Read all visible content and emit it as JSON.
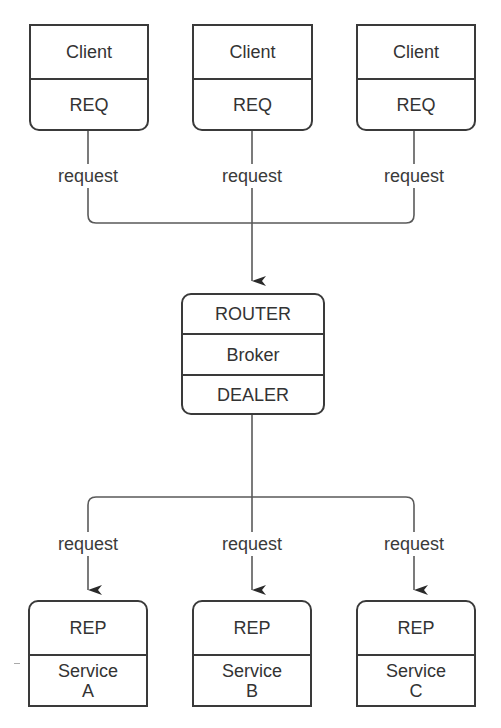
{
  "diagram": {
    "colors": {
      "stroke": "#3a3a3a",
      "text": "#333333",
      "background": "#ffffff"
    },
    "clients": [
      {
        "title": "Client",
        "socket": "REQ"
      },
      {
        "title": "Client",
        "socket": "REQ"
      },
      {
        "title": "Client",
        "socket": "REQ"
      }
    ],
    "client_edge_labels": [
      "request",
      "request",
      "request"
    ],
    "broker": {
      "frontend": "ROUTER",
      "title": "Broker",
      "backend": "DEALER"
    },
    "service_edge_labels": [
      "request",
      "request",
      "request"
    ],
    "services": [
      {
        "socket": "REP",
        "name_line1": "Service",
        "name_line2": "A"
      },
      {
        "socket": "REP",
        "name_line1": "Service",
        "name_line2": "B"
      },
      {
        "socket": "REP",
        "name_line1": "Service",
        "name_line2": "C"
      }
    ]
  }
}
